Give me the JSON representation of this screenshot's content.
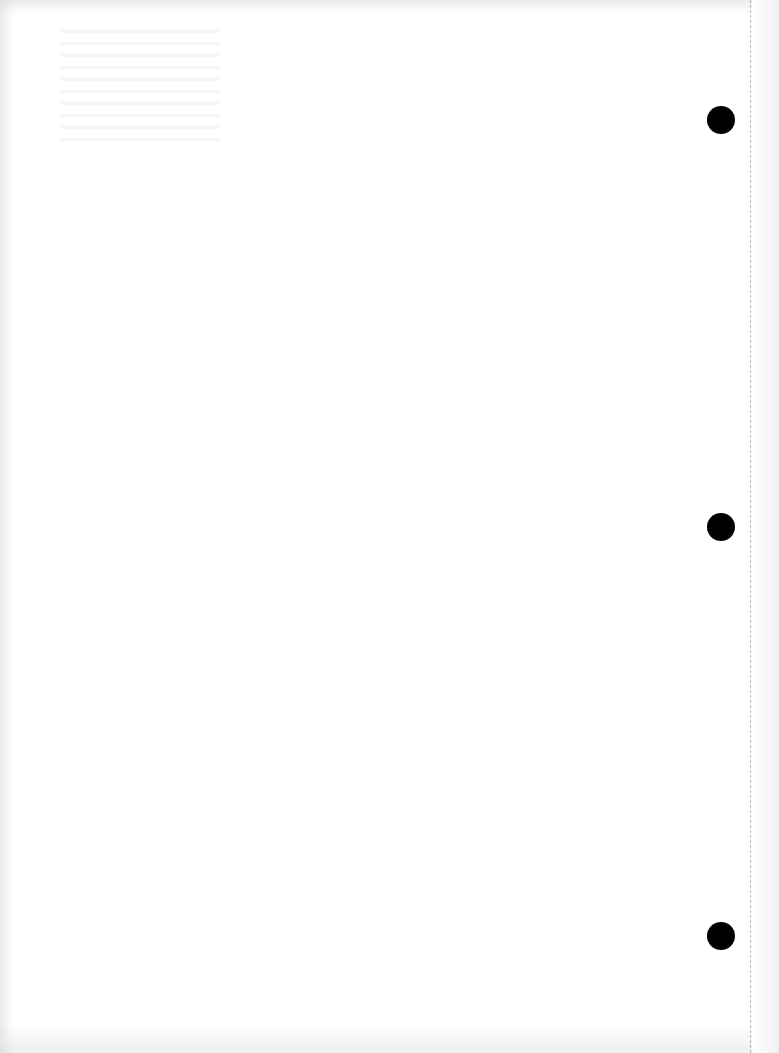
{
  "page": {
    "type": "blank scanned page",
    "background_color": "#ffffff",
    "punch_holes": [
      {
        "id": "top",
        "top": 106
      },
      {
        "id": "middle",
        "top": 513
      },
      {
        "id": "bottom",
        "top": 922
      }
    ],
    "punch_hole_color": "#000000",
    "tear_line_color": "#b8b8b8"
  }
}
